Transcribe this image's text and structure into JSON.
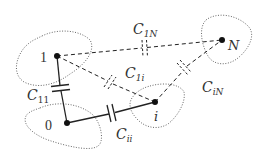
{
  "diagram": {
    "title": "",
    "colors": {
      "stroke": "#222222",
      "blob": "#555555",
      "text": "#333333"
    },
    "nodes": [
      {
        "id": "1",
        "label": "1"
      },
      {
        "id": "N",
        "label": "N"
      },
      {
        "id": "0",
        "label": "0"
      },
      {
        "id": "i",
        "label": "i"
      }
    ],
    "capacitors": [
      {
        "id": "C11",
        "main": "C",
        "sub": "11",
        "from": "1",
        "to": "0",
        "style": "solid"
      },
      {
        "id": "Cii",
        "main": "C",
        "sub": "ii",
        "from": "0",
        "to": "i",
        "style": "solid"
      },
      {
        "id": "C1i",
        "main": "C",
        "sub": "1i",
        "from": "1",
        "to": "i",
        "style": "dashed"
      },
      {
        "id": "C1N",
        "main": "C",
        "sub": "1N",
        "from": "1",
        "to": "N",
        "style": "dashed"
      },
      {
        "id": "CiN",
        "main": "C",
        "sub": "iN",
        "from": "i",
        "to": "N",
        "style": "dashed"
      }
    ]
  }
}
